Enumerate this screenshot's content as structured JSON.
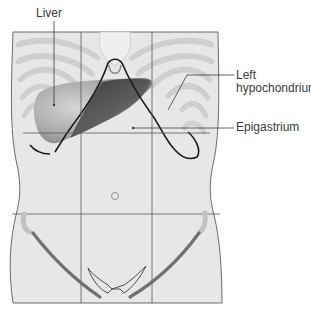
{
  "figure": {
    "labels": {
      "liver": "Liver",
      "left_hypochondrium_line1": "Left",
      "left_hypochondrium_line2": "hypochondrium",
      "epigastrium": "Epigastrium"
    },
    "colors": {
      "skin": "#e6e6e6",
      "outline": "#6b6b6b",
      "grid_line": "#5a5a5a",
      "rib": "#d4d4d4",
      "liver": "#a8a8a8",
      "stomach": "#4a4a4a",
      "costal_margin": "#1a1a1a",
      "iliac_crest": "#6e6e6e",
      "label_text": "#3a3a3a"
    },
    "regions": {
      "vertical_lines_x": [
        81,
        152
      ],
      "horizontal_lines_y": [
        133,
        214
      ]
    }
  }
}
